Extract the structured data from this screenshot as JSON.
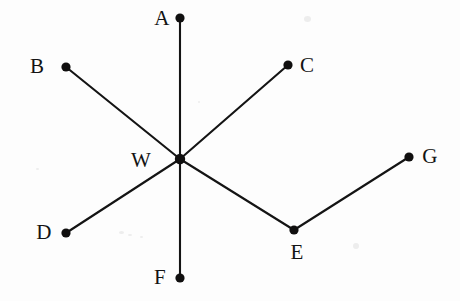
{
  "figure": {
    "background_color": "#fdfdfd",
    "line_color": "#141414",
    "dot_color": "#100f0f",
    "width": 460,
    "height": 301,
    "vertices": [
      {
        "id": "A",
        "label": "A",
        "x": 180,
        "y": 18,
        "label_x": 162,
        "label_y": 18
      },
      {
        "id": "B",
        "label": "B",
        "x": 66,
        "y": 67,
        "label_x": 37,
        "label_y": 66
      },
      {
        "id": "C",
        "label": "C",
        "x": 288,
        "y": 65,
        "label_x": 307,
        "label_y": 65
      },
      {
        "id": "W",
        "label": "W",
        "x": 180,
        "y": 159,
        "label_x": 141,
        "label_y": 160
      },
      {
        "id": "D",
        "label": "D",
        "x": 66,
        "y": 233,
        "label_x": 44,
        "label_y": 232
      },
      {
        "id": "E",
        "label": "E",
        "x": 294,
        "y": 230,
        "label_x": 297,
        "label_y": 252
      },
      {
        "id": "F",
        "label": "F",
        "x": 180,
        "y": 278,
        "label_x": 160,
        "label_y": 277
      },
      {
        "id": "G",
        "label": "G",
        "x": 409,
        "y": 157,
        "label_x": 430,
        "label_y": 156
      }
    ],
    "edges": [
      {
        "id": "edge-A-F",
        "from": "A",
        "to": "F",
        "x1": 180,
        "y1": 18,
        "x2": 180,
        "y2": 278
      },
      {
        "id": "edge-B-W",
        "from": "B",
        "to": "W",
        "x1": 66,
        "y1": 67,
        "x2": 180,
        "y2": 159
      },
      {
        "id": "edge-W-C",
        "from": "W",
        "to": "C",
        "x1": 180,
        "y1": 159,
        "x2": 288,
        "y2": 65
      },
      {
        "id": "edge-D-W",
        "from": "D",
        "to": "W",
        "x1": 66,
        "y1": 233,
        "x2": 180,
        "y2": 159
      },
      {
        "id": "edge-W-E",
        "from": "W",
        "to": "E",
        "x1": 180,
        "y1": 159,
        "x2": 294,
        "y2": 230
      },
      {
        "id": "edge-E-G",
        "from": "E",
        "to": "G",
        "x1": 294,
        "y1": 230,
        "x2": 409,
        "y2": 157
      }
    ],
    "dot_radius": 4.6,
    "center_dot_radius": 5.2
  }
}
